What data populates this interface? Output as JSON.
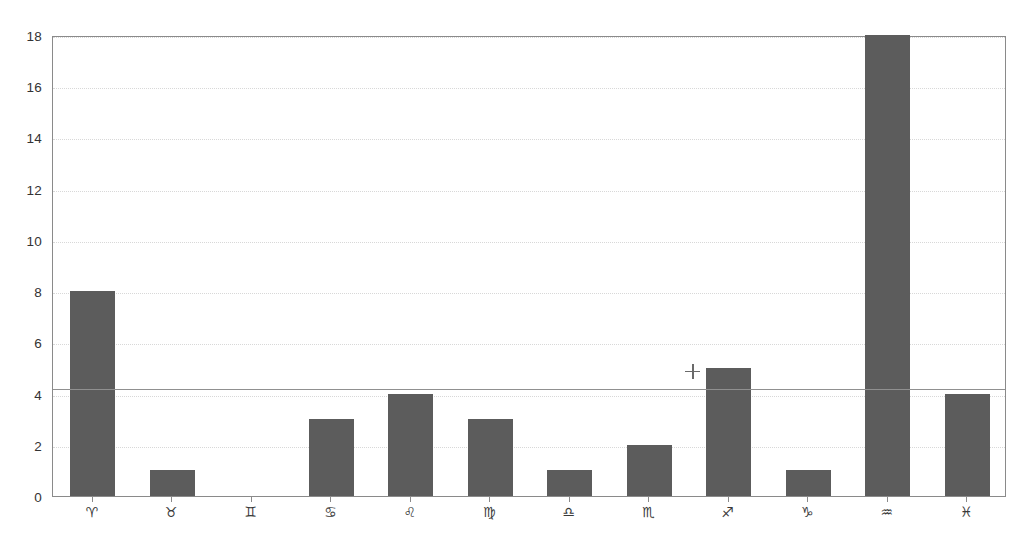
{
  "chart_data": {
    "type": "bar",
    "title": "",
    "subtitle": "",
    "xlabel": "",
    "ylabel": "",
    "categories": [
      "♈",
      "♉",
      "♊",
      "♋",
      "♌",
      "♍",
      "♎",
      "♏",
      "♐",
      "♑",
      "♒",
      "♓"
    ],
    "category_names": [
      "Aries",
      "Taurus",
      "Gemini",
      "Cancer",
      "Leo",
      "Virgo",
      "Libra",
      "Scorpio",
      "Sagittarius",
      "Capricorn",
      "Aquarius",
      "Pisces"
    ],
    "values": [
      8,
      1,
      0,
      3,
      4,
      3,
      1,
      2,
      5,
      1,
      18,
      4
    ],
    "ylim": [
      0,
      18
    ],
    "yticks": [
      0,
      2,
      4,
      6,
      8,
      10,
      12,
      14,
      16,
      18
    ],
    "ytick_labels": [
      "0",
      "2",
      "4",
      "6",
      "8",
      "10",
      "12",
      "14",
      "16",
      "18"
    ],
    "grid": true,
    "grid_axis": "y",
    "grid_style": "dotted",
    "legend": false,
    "bar_color": "#5c5c5c",
    "reference_line": {
      "value": 4.25,
      "style": "solid",
      "color": "#909090"
    },
    "markers": [
      {
        "symbol": "+",
        "x_category_index": 7.55,
        "y": 4.95,
        "color": "#6a6a6a"
      }
    ]
  }
}
